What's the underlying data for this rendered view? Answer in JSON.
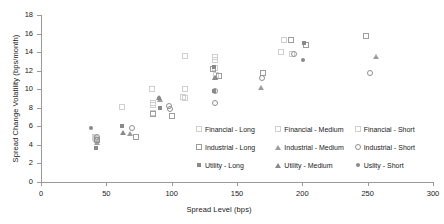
{
  "chart_data": {
    "type": "scatter",
    "title": "",
    "xlabel": "Spread Level (bps)",
    "ylabel": "Spread Change Volatility (bps/month)",
    "xlim": [
      0,
      300
    ],
    "ylim": [
      0,
      18
    ],
    "xticks": [
      0,
      50,
      100,
      150,
      200,
      250,
      300
    ],
    "yticks": [
      0,
      2,
      4,
      6,
      8,
      10,
      12,
      14,
      16,
      18
    ],
    "grid": false,
    "legend_position": "inside-lower-right",
    "series": [
      {
        "name": "Financial - Long",
        "marker": "square-open-light",
        "color": "#cfcfcf",
        "points": [
          [
            41,
            4.8
          ],
          [
            62,
            8.1
          ],
          [
            85,
            10.0
          ],
          [
            86,
            8.5
          ],
          [
            110,
            13.6
          ],
          [
            110,
            10.0
          ],
          [
            133,
            13.5
          ],
          [
            184,
            14.0
          ],
          [
            192,
            13.8
          ]
        ]
      },
      {
        "name": "Financial - Medium",
        "marker": "square-open-light",
        "color": "#cfcfcf",
        "points": [
          [
            41,
            4.7
          ],
          [
            86,
            8.3
          ],
          [
            109,
            9.2
          ],
          [
            133,
            13.2
          ],
          [
            134,
            11.5
          ],
          [
            186,
            15.3
          ]
        ]
      },
      {
        "name": "Financial - Short",
        "marker": "square-open-light",
        "color": "#cfcfcf",
        "points": [
          [
            42,
            4.6
          ],
          [
            86,
            7.4
          ],
          [
            110,
            9.1
          ],
          [
            133,
            12.3
          ],
          [
            170,
            11.8
          ]
        ]
      },
      {
        "name": "Industrial - Long",
        "marker": "square-open",
        "color": "#9d9d9d",
        "points": [
          [
            43,
            4.5
          ],
          [
            73,
            4.9
          ],
          [
            86,
            7.3
          ],
          [
            100,
            7.1
          ],
          [
            132,
            12.2
          ],
          [
            136,
            11.4
          ],
          [
            170,
            11.8
          ],
          [
            191,
            15.3
          ],
          [
            203,
            14.8
          ],
          [
            249,
            15.7
          ]
        ]
      },
      {
        "name": "Industrial - Medium",
        "marker": "triangle-open",
        "color": "#9d9d9d",
        "points": [
          [
            43,
            4.2
          ],
          [
            68,
            5.2
          ],
          [
            91,
            8.8
          ],
          [
            133,
            11.2
          ],
          [
            168,
            10.1
          ],
          [
            256,
            13.5
          ]
        ]
      },
      {
        "name": "Industrial - Short",
        "marker": "circle-open",
        "color": "#8f8f8f",
        "points": [
          [
            43,
            4.9
          ],
          [
            43,
            4.5
          ],
          [
            70,
            5.8
          ],
          [
            98,
            8.2
          ],
          [
            99,
            7.9
          ],
          [
            133,
            9.8
          ],
          [
            133,
            8.5
          ],
          [
            169,
            11.2
          ],
          [
            194,
            13.8
          ],
          [
            252,
            11.8
          ]
        ]
      },
      {
        "name": "Utility - Long",
        "marker": "square-filled",
        "color": "#8a8a8a",
        "points": [
          [
            43,
            3.6
          ],
          [
            63,
            5.9
          ],
          [
            92,
            7.9
          ],
          [
            133,
            12.3
          ],
          [
            133,
            9.7
          ],
          [
            202,
            14.9
          ]
        ]
      },
      {
        "name": "Utility - Medium",
        "marker": "triangle-filled",
        "color": "#8a8a8a",
        "points": [
          [
            63,
            5.3
          ],
          [
            90,
            9.1
          ],
          [
            133,
            11.2
          ]
        ]
      },
      {
        "name": "Uslity - Short",
        "marker": "circle-filled",
        "color": "#8a8a8a",
        "points": [
          [
            39,
            5.7
          ],
          [
            91,
            9.0
          ],
          [
            201,
            13.0
          ]
        ]
      }
    ]
  },
  "legend": {
    "entries": [
      {
        "label": "Financial - Long",
        "marker": "square-open-light"
      },
      {
        "label": "Financial - Medium",
        "marker": "square-open-light"
      },
      {
        "label": "Financial - Short",
        "marker": "square-open-light"
      },
      {
        "label": "Industrial - Long",
        "marker": "square-open"
      },
      {
        "label": "Industrial - Medium",
        "marker": "triangle-open"
      },
      {
        "label": "Industrial - Short",
        "marker": "circle-open"
      },
      {
        "label": "Utility - Long",
        "marker": "square-filled"
      },
      {
        "label": "Utility - Medium",
        "marker": "triangle-filled"
      },
      {
        "label": "Uslity - Short",
        "marker": "circle-filled"
      }
    ]
  },
  "colors": {
    "axis": "#9a9a9a",
    "text": "#1a1a1a",
    "marker_light": "#cfcfcf",
    "marker_mid": "#9d9d9d",
    "marker_dark": "#8a8a8a",
    "background": "#ffffff"
  }
}
